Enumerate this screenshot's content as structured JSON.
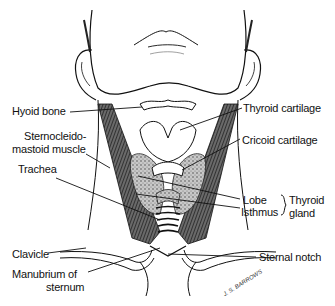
{
  "diagram": {
    "colors": {
      "ink": "#111111",
      "paper": "#ffffff",
      "muscle": "#3a3a3a",
      "gland": "#9a9a9a"
    }
  },
  "labels": {
    "left": [
      {
        "id": "hyoid",
        "text": "Hyoid bone"
      },
      {
        "id": "scm_1",
        "text": "Sternocleido-"
      },
      {
        "id": "scm_2",
        "text": "mastoid muscle"
      },
      {
        "id": "trachea",
        "text": "Trachea"
      },
      {
        "id": "clavicle",
        "text": "Clavicle"
      },
      {
        "id": "manubrium_1",
        "text": "Manubrium of"
      },
      {
        "id": "manubrium_2",
        "text": "sternum"
      }
    ],
    "right": [
      {
        "id": "thyroid_cartilage",
        "text": "Thyroid cartilage"
      },
      {
        "id": "cricoid_cartilage",
        "text": "Cricoid cartilage"
      },
      {
        "id": "lobe",
        "text": "Lobe"
      },
      {
        "id": "isthmus",
        "text": "Isthmus"
      },
      {
        "id": "thyroid_gland_1",
        "text": "Thyroid"
      },
      {
        "id": "thyroid_gland_2",
        "text": "gland"
      },
      {
        "id": "sternal_notch",
        "text": "Sternal notch"
      }
    ]
  },
  "signature": "J. S. BARROWS"
}
